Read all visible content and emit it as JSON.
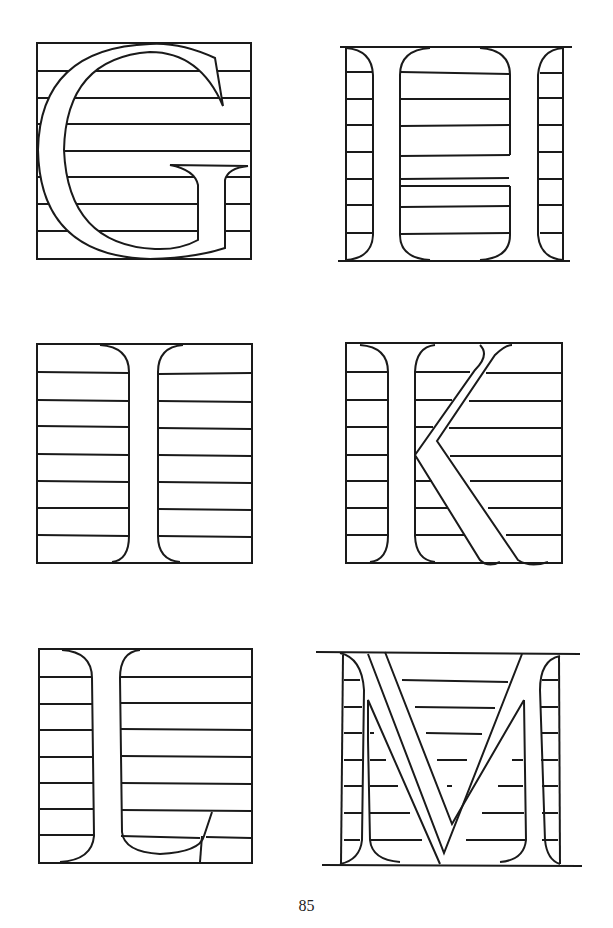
{
  "page": {
    "page_number": "85",
    "ink_color": "#1a1a1a",
    "paper_color": "#ffffff"
  },
  "letters": [
    {
      "char": "G",
      "position": "top-left"
    },
    {
      "char": "H",
      "position": "top-right"
    },
    {
      "char": "I",
      "position": "middle-left"
    },
    {
      "char": "K",
      "position": "middle-right"
    },
    {
      "char": "L",
      "position": "bottom-left"
    },
    {
      "char": "M",
      "position": "bottom-right"
    }
  ]
}
